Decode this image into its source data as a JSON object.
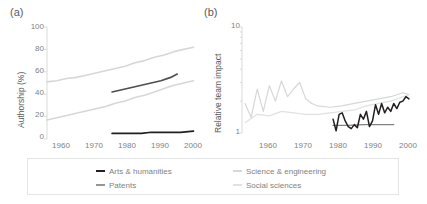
{
  "figure": {
    "panels": [
      {
        "letter": "(a)",
        "ylabel": "Authorship (%)",
        "yticks": [
          "0",
          "20",
          "40",
          "60",
          "80",
          "100"
        ],
        "xticks": [
          "1960",
          "1970",
          "1980",
          "1990",
          "2000"
        ]
      },
      {
        "letter": "(b)",
        "ylabel": "Relative team impact",
        "yticks": [
          "1",
          "10"
        ],
        "xticks": [
          "1960",
          "1970",
          "1980",
          "1990",
          "2000"
        ]
      }
    ]
  },
  "legend": {
    "items": [
      {
        "label": "Arts & humanities",
        "color": "#231f20"
      },
      {
        "label": "Patents",
        "color": "#939598"
      },
      {
        "label": "Science & engineering",
        "color": "#d6d7d8"
      },
      {
        "label": "Social sciences",
        "color": "#e0e1e2"
      }
    ]
  },
  "colors": {
    "axis": "#d9dadb",
    "tick_text": "#808285",
    "label_text": "#58595b",
    "arts_humanities": "#231f20",
    "patents": "#939598",
    "science_engineering": "#d6d7d8",
    "social_sciences": "#e0e1e2"
  },
  "chart_data": [
    {
      "type": "line",
      "panel": "(a)",
      "title": "",
      "xlabel": "",
      "ylabel": "Authorship (%)",
      "xlim": [
        1955,
        2000
      ],
      "ylim": [
        0,
        100
      ],
      "xticks": [
        1960,
        1970,
        1980,
        1990,
        2000
      ],
      "yticks": [
        0,
        20,
        40,
        60,
        80,
        100
      ],
      "grid": false,
      "legend_position": "below",
      "series": [
        {
          "name": "Science & engineering",
          "color": "#d6d7d8",
          "x": [
            1955,
            1958,
            1961,
            1964,
            1967,
            1970,
            1973,
            1976,
            1979,
            1982,
            1985,
            1988,
            1991,
            1994,
            1997,
            2000
          ],
          "y": [
            51,
            52,
            54,
            55,
            57,
            59,
            61,
            63,
            65,
            68,
            70,
            73,
            75,
            78,
            80,
            82
          ]
        },
        {
          "name": "Social sciences",
          "color": "#d6d7d8",
          "x": [
            1955,
            1958,
            1961,
            1964,
            1967,
            1970,
            1973,
            1976,
            1979,
            1982,
            1985,
            1988,
            1991,
            1994,
            1997,
            2000
          ],
          "y": [
            17,
            19,
            21,
            23,
            25,
            27,
            29,
            32,
            34,
            37,
            39,
            42,
            45,
            48,
            50,
            52
          ]
        },
        {
          "name": "Patents",
          "color": "#4d4e50",
          "x": [
            1975,
            1978,
            1981,
            1984,
            1987,
            1990,
            1993,
            1995
          ],
          "y": [
            42,
            44,
            46,
            48,
            50,
            52,
            55,
            58
          ]
        },
        {
          "name": "Arts & humanities",
          "color": "#231f20",
          "x": [
            1975,
            1978,
            1981,
            1984,
            1987,
            1990,
            1993,
            1996,
            2000
          ],
          "y": [
            5,
            5,
            5,
            5,
            6,
            6,
            6,
            6,
            7
          ]
        }
      ]
    },
    {
      "type": "line",
      "panel": "(b)",
      "title": "",
      "xlabel": "",
      "ylabel": "Relative team impact",
      "xlim": [
        1945,
        2002
      ],
      "ylim": [
        1,
        10
      ],
      "yscale": "log",
      "xticks": [
        1960,
        1970,
        1980,
        1990,
        2000
      ],
      "yticks": [
        1,
        10
      ],
      "grid": false,
      "legend_position": "below",
      "series": [
        {
          "name": "Social sciences",
          "color": "#d6d7d8",
          "x": [
            1946,
            1948,
            1950,
            1952,
            1954,
            1956,
            1958,
            1960,
            1962,
            1964,
            1966,
            1968,
            1970,
            1974,
            1978,
            1982,
            1986,
            1990,
            1994,
            1998,
            2000
          ],
          "y": [
            1.9,
            1.4,
            2.6,
            1.6,
            2.8,
            2.0,
            3.1,
            2.2,
            2.6,
            3.0,
            2.1,
            1.9,
            1.8,
            1.75,
            1.8,
            1.9,
            2.0,
            2.1,
            2.2,
            2.4,
            2.3
          ]
        },
        {
          "name": "Science & engineering",
          "color": "#e0e1e2",
          "x": [
            1946,
            1950,
            1954,
            1958,
            1962,
            1966,
            1970,
            1974,
            1978,
            1982,
            1986,
            1990,
            1994,
            1998,
            2000
          ],
          "y": [
            1.25,
            1.5,
            1.45,
            1.6,
            1.55,
            1.5,
            1.5,
            1.55,
            1.6,
            1.65,
            1.8,
            1.9,
            2.0,
            2.2,
            2.3
          ]
        },
        {
          "name": "Patents",
          "color": "#808285",
          "x": [
            1975,
            1980,
            1985,
            1990,
            1995
          ],
          "y": [
            1.18,
            1.18,
            1.2,
            1.2,
            1.2
          ]
        },
        {
          "name": "Arts & humanities",
          "color": "#231f20",
          "x": [
            1975,
            1976,
            1977,
            1978,
            1979,
            1980,
            1981,
            1982,
            1983,
            1984,
            1985,
            1986,
            1987,
            1988,
            1989,
            1990,
            1991,
            1992,
            1993,
            1994,
            1995,
            1996,
            1997,
            1998,
            1999,
            2000
          ],
          "y": [
            1.35,
            1.05,
            1.5,
            1.55,
            1.3,
            1.15,
            1.1,
            1.2,
            1.12,
            1.5,
            1.35,
            1.6,
            1.15,
            1.3,
            1.85,
            1.5,
            1.9,
            1.55,
            1.75,
            1.6,
            1.9,
            1.7,
            1.95,
            2.0,
            2.2,
            2.1
          ]
        }
      ]
    }
  ]
}
